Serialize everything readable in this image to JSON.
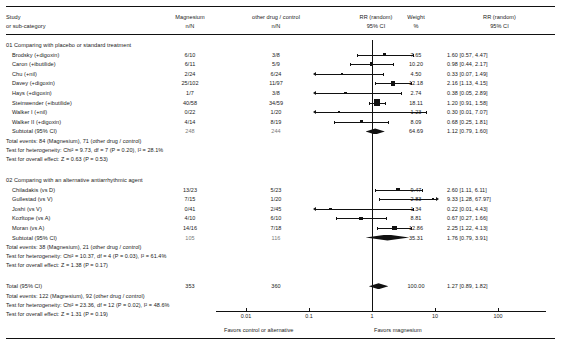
{
  "header": {
    "col_study_line1": "Study",
    "col_study_line2": "or sub-category",
    "col_treat_line1": "Magnesium",
    "col_treat_line2": "n/N",
    "col_control_line1": "other drug / control",
    "col_control_line2": "n/N",
    "col_effect_line1": "RR (random)",
    "col_effect_line2": "95% CI",
    "col_weight_line1": "Weight",
    "col_weight_line2": "%",
    "col_effect2_line1": "RR (random)",
    "col_effect2_line2": "95% CI"
  },
  "axis": {
    "ticks": [
      "0.01",
      "0.1",
      "1",
      "10",
      "100"
    ],
    "left_label": "Favors control or alternative",
    "right_label": "Favors magnesium"
  },
  "chart_data": {
    "type": "forest",
    "title": "RR (random) 95% CI",
    "xlabel": "Risk Ratio",
    "xscale": "log",
    "xlim": [
      0.01,
      100
    ],
    "ticks": [
      0.01,
      0.1,
      1,
      10,
      100
    ],
    "null_value": 1,
    "groups": [
      {
        "label": "01 Comparing with placebo or standard treatment",
        "studies": [
          {
            "name": "Brodsky (+digoxin)",
            "treat": "6/10",
            "control": "3/8",
            "weight": "7.65",
            "rr": "1.60",
            "ci": "[0.57, 4.47]",
            "rr_val": 1.6,
            "lo": 0.57,
            "hi": 4.47
          },
          {
            "name": "Caron (+ibutilide)",
            "treat": "6/11",
            "control": "5/9",
            "weight": "10.20",
            "rr": "0.98",
            "ci": "[0.44, 2.17]",
            "rr_val": 0.98,
            "lo": 0.44,
            "hi": 2.17
          },
          {
            "name": "Chu (+nil)",
            "treat": "2/24",
            "control": "6/24",
            "weight": "4.50",
            "rr": "0.33",
            "ci": "[0.07, 1.49]",
            "rr_val": 0.33,
            "lo": 0.07,
            "hi": 1.49
          },
          {
            "name": "Davey (+digoxin)",
            "treat": "25/102",
            "control": "11/97",
            "weight": "12.18",
            "rr": "2.16",
            "ci": "[1.13, 4.15]",
            "rr_val": 2.16,
            "lo": 1.13,
            "hi": 4.15
          },
          {
            "name": "Hays (+digoxin)",
            "treat": "1/7",
            "control": "3/8",
            "weight": "2.74",
            "rr": "0.38",
            "ci": "[0.05, 2.89]",
            "rr_val": 0.38,
            "lo": 0.05,
            "hi": 2.89
          },
          {
            "name": "Steinwender (+ibutilide)",
            "treat": "40/58",
            "control": "34/59",
            "weight": "18.11",
            "rr": "1.20",
            "ci": "[0.91, 1.58]",
            "rr_val": 1.2,
            "lo": 0.91,
            "hi": 1.58
          },
          {
            "name": "Walker I (+nil)",
            "treat": "0/22",
            "control": "1/20",
            "weight": "1.23",
            "rr": "0.30",
            "ci": "[0.01, 7.07]",
            "rr_val": 0.3,
            "lo": 0.01,
            "hi": 7.07
          },
          {
            "name": "Walker II (+digoxin)",
            "treat": "4/14",
            "control": "8/19",
            "weight": "8.09",
            "rr": "0.68",
            "ci": "[0.25, 1.81]",
            "rr_val": 0.68,
            "lo": 0.25,
            "hi": 1.81
          }
        ],
        "subtotal": {
          "label": "Subtotal (95% CI)",
          "treat_total": "248",
          "control_total": "244",
          "weight": "64.69",
          "rr": "1.12",
          "ci": "[0.79, 1.60]",
          "rr_val": 1.12,
          "lo": 0.79,
          "hi": 1.6
        },
        "events": "Total events: 84 (Magnesium), 71 (other drug / control)",
        "heterogeneity": "Test for heterogeneity: Chi² = 9.73, df = 7 (P = 0.20), I² = 28.1%",
        "overall": "Test for overall effect: Z = 0.63 (P = 0.53)"
      },
      {
        "label": "02 Comparing with an alternative antiarrhythmic agent",
        "studies": [
          {
            "name": "Chiladakis (vs D)",
            "treat": "13/23",
            "control": "5/23",
            "weight": "9.47",
            "rr": "2.60",
            "ci": "[1.11, 6.11]",
            "rr_val": 2.6,
            "lo": 1.11,
            "hi": 6.11
          },
          {
            "name": "Gullestad (vs V)",
            "treat": "7/15",
            "control": "1/20",
            "weight": "2.83",
            "rr": "9.33",
            "ci": "[1.28, 67.97]",
            "rr_val": 9.33,
            "lo": 1.28,
            "hi": 67.97
          },
          {
            "name": "Joshi (vs V)",
            "treat": "0/41",
            "control": "2/45",
            "weight": "1.34",
            "rr": "0.22",
            "ci": "[0.01, 4.43]",
            "rr_val": 0.22,
            "lo": 0.01,
            "hi": 4.43
          },
          {
            "name": "Kozltope (vs A)",
            "treat": "4/10",
            "control": "6/10",
            "weight": "8.81",
            "rr": "0.67",
            "ci": "[0.27, 1.66]",
            "rr_val": 0.67,
            "lo": 0.27,
            "hi": 1.66
          },
          {
            "name": "Moran (vs A)",
            "treat": "14/16",
            "control": "7/18",
            "weight": "12.86",
            "rr": "2.25",
            "ci": "[1.22, 4.13]",
            "rr_val": 2.25,
            "lo": 1.22,
            "hi": 4.13
          }
        ],
        "subtotal": {
          "label": "Subtotal (95% CI)",
          "treat_total": "105",
          "control_total": "116",
          "weight": "35.31",
          "rr": "1.76",
          "ci": "[0.79, 3.91]",
          "rr_val": 1.76,
          "lo": 0.79,
          "hi": 3.91
        },
        "events": "Total events: 38 (Magnesium), 21 (other drug / control)",
        "heterogeneity": "Test for heterogeneity: Chi² = 10.37, df = 4 (P = 0.03), I² = 61.4%",
        "overall": "Test for overall effect: Z = 1.38 (P = 0.17)"
      }
    ],
    "total": {
      "label": "Total (95% CI)",
      "treat_total": "353",
      "control_total": "360",
      "weight": "100.00",
      "rr": "1.27",
      "ci": "[0.89, 1.82]",
      "rr_val": 1.27,
      "lo": 0.89,
      "hi": 1.82,
      "events": "Total events: 122 (Magnesium), 92 (other drug / control)",
      "heterogeneity": "Test for heterogeneity: Chi² = 23.36, df = 12 (P = 0.02), I² = 48.6%",
      "overall": "Test for overall effect: Z = 1.31 (P = 0.19)"
    }
  }
}
